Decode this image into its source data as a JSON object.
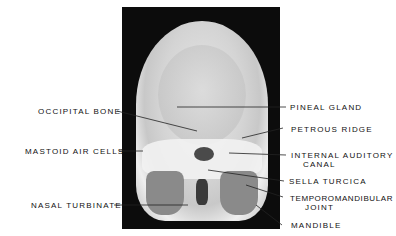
{
  "figure": {
    "type": "Frontal skull radiograph (PA view) with anatomical labels",
    "labels_left": [
      {
        "id": "occipital-bone",
        "text": "OCCIPITAL BONE"
      },
      {
        "id": "mastoid-air-cells",
        "text": "MASTOID AIR CELLS"
      },
      {
        "id": "nasal-turbinate",
        "text": "NASAL TURBINATE"
      }
    ],
    "labels_right": [
      {
        "id": "pineal-gland",
        "text": "PINEAL GLAND"
      },
      {
        "id": "petrous-ridge",
        "text": "PETROUS RIDGE"
      },
      {
        "id": "internal-auditory-canal",
        "line1": "INTERNAL AUDITORY",
        "line2": "CANAL"
      },
      {
        "id": "sella-turcica",
        "text": "SELLA TURCICA"
      },
      {
        "id": "temporomandibular-joint",
        "line1": "TEMPOROMANDIBULAR",
        "line2": "JOINT"
      },
      {
        "id": "mandible",
        "text": "MANDIBLE"
      }
    ]
  }
}
